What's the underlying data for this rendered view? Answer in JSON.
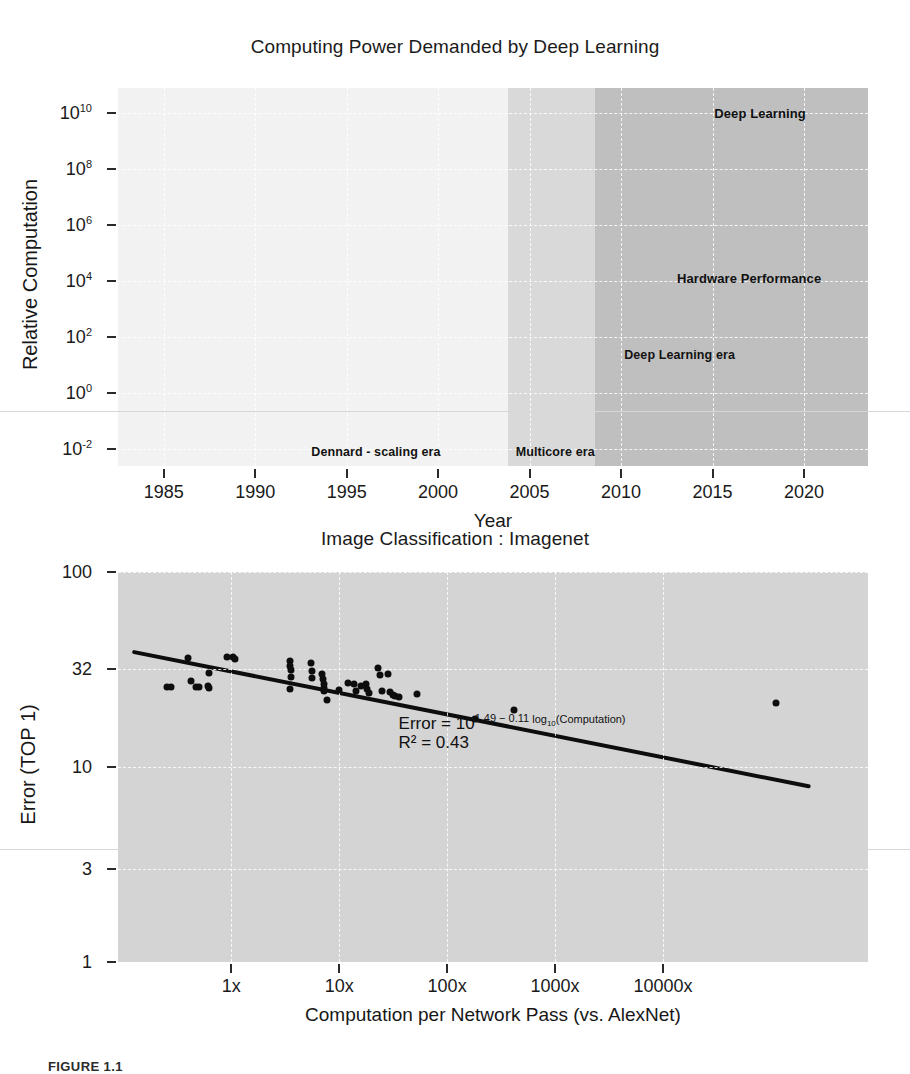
{
  "figure": {
    "caption_label": "FIGURE 1.1"
  },
  "chart_data": [
    {
      "type": "line",
      "title": "Computing Power Demanded by Deep Learning",
      "xlabel": "Year",
      "ylabel": "Relative Computation",
      "xlim": [
        1982.5,
        2023.5
      ],
      "ylim": [
        -2.6,
        10.9
      ],
      "xticks": [
        "1985",
        "1990",
        "1995",
        "2000",
        "2005",
        "2010",
        "2015",
        "2020"
      ],
      "xtick_values": [
        1985,
        1990,
        1995,
        2000,
        2005,
        2010,
        2015,
        2020
      ],
      "yticks": [
        "10-2",
        "100",
        "102",
        "104",
        "106",
        "108",
        "1010"
      ],
      "ytick_bases": [
        "10",
        "10",
        "10",
        "10",
        "10",
        "10",
        "10"
      ],
      "ytick_exponents": [
        "-2",
        "0",
        "2",
        "4",
        "6",
        "8",
        "10"
      ],
      "ytick_values": [
        -2,
        0,
        2,
        4,
        6,
        8,
        10
      ],
      "grid": true,
      "legend": "none",
      "annotations": [
        {
          "text": "Deep Learning",
          "x": 2017.6,
          "y": 10.0
        },
        {
          "text": "Hardware Performance",
          "x": 2017.0,
          "y": 4.1
        },
        {
          "text": "Deep Learning era",
          "x": 2013.2,
          "y": 1.35
        },
        {
          "text": "Dennard - scaling era",
          "x": 1996.6,
          "y": -2.1
        },
        {
          "text": "Multicore era",
          "x": 2006.4,
          "y": -2.1
        }
      ],
      "eras": [
        {
          "name": "Dennard - scaling era",
          "x_start": 1982.5,
          "x_end": 2003.8,
          "shade": "#f2f2f2"
        },
        {
          "name": "Multicore era",
          "x_start": 2003.8,
          "x_end": 2008.6,
          "shade": "#d9d9d9"
        },
        {
          "name": "Deep Learning era",
          "x_start": 2008.6,
          "x_end": 2023.5,
          "shade": "#bfbfbf"
        }
      ],
      "series": [
        {
          "name": "Hardware Performance",
          "color": "#111111",
          "style": "thick-line",
          "x": [
            1983,
            1985,
            1986,
            1988,
            1990,
            1992,
            1994,
            1996,
            1998,
            2000,
            2002,
            2003.8,
            2005,
            2006.5,
            2008.6
          ],
          "y": [
            -2.0,
            -2.0,
            -1.75,
            -1.25,
            -1.1,
            -0.75,
            -0.35,
            0.0,
            0.25,
            0.45,
            0.85,
            1.0,
            1.2,
            1.4,
            1.6
          ]
        },
        {
          "name": "Hardware Performance band (upper)",
          "color": "#111111",
          "style": "wedge-upper",
          "x": [
            2008.6,
            2016.2
          ],
          "y": [
            1.7,
            3.35
          ]
        },
        {
          "name": "Hardware Performance band (lower)",
          "color": "#111111",
          "style": "wedge-lower",
          "x": [
            2008.6,
            2016.2
          ],
          "y": [
            1.5,
            1.85
          ]
        },
        {
          "name": "Deep Learning",
          "color": "#b6b6b6",
          "style": "thin-line",
          "x": [
            1986.4,
            1987.5,
            1989,
            1990.5,
            1992,
            1994,
            1996,
            1998,
            2000,
            2002,
            2003.2,
            2004.6,
            2006,
            2008.6,
            2010.2,
            2012,
            2014,
            2016,
            2018,
            2020,
            2022,
            2023.5
          ],
          "y": [
            -2.55,
            -2.0,
            -0.9,
            -0.2,
            0.1,
            0.35,
            0.5,
            0.35,
            0.25,
            0.3,
            0.55,
            0.95,
            2.0,
            4.3,
            5.0,
            6.6,
            8.1,
            9.0,
            9.55,
            10.0,
            10.5,
            10.8
          ]
        }
      ]
    },
    {
      "type": "scatter",
      "title": "Image Classification : Imagenet",
      "xlabel": "Computation per Network Pass (vs. AlexNet)",
      "ylabel": "Error (TOP 1)",
      "xlim": [
        -1.05,
        5.9
      ],
      "ylim": [
        0,
        2
      ],
      "xticks": [
        "1x",
        "10x",
        "100x",
        "1000x",
        "10000x"
      ],
      "xtick_values": [
        0,
        1,
        2,
        3,
        4
      ],
      "yticks": [
        "100",
        "32",
        "10",
        "3",
        "1"
      ],
      "ytick_values": [
        2.0,
        1.505,
        1.0,
        0.477,
        0.0
      ],
      "grid": true,
      "legend": "none",
      "annotations": [
        {
          "text": "Error = 10",
          "sup_a": "1.49 − 0.11 ",
          "sup_log": "log",
          "sub_10": "10",
          "sup_tail": "(Computation)",
          "x": 1.55,
          "y": 1.27
        },
        {
          "text": "R² = 0.43",
          "x": 1.55,
          "y": 1.175
        }
      ],
      "fit": {
        "name": "regression-line",
        "equation": "Error = 10^(1.49 - 0.11 log10(Computation))",
        "r_squared": 0.43,
        "intercept": 1.49,
        "slope": -0.11,
        "color": "#0d0d0d",
        "x": [
          -0.9,
          5.35
        ],
        "y": [
          1.589,
          0.901
        ]
      },
      "points": [
        {
          "x": -0.6,
          "y": 1.41
        },
        {
          "x": -0.56,
          "y": 1.41
        },
        {
          "x": -0.4,
          "y": 1.56
        },
        {
          "x": -0.37,
          "y": 1.44
        },
        {
          "x": -0.33,
          "y": 1.41
        },
        {
          "x": -0.3,
          "y": 1.41
        },
        {
          "x": -0.21,
          "y": 1.48
        },
        {
          "x": -0.215,
          "y": 1.415
        },
        {
          "x": -0.205,
          "y": 1.405
        },
        {
          "x": -0.04,
          "y": 1.565
        },
        {
          "x": 0.02,
          "y": 1.565
        },
        {
          "x": 0.03,
          "y": 1.555
        },
        {
          "x": 0.54,
          "y": 1.545
        },
        {
          "x": 0.545,
          "y": 1.52
        },
        {
          "x": 0.55,
          "y": 1.495
        },
        {
          "x": 0.55,
          "y": 1.46
        },
        {
          "x": 0.545,
          "y": 1.4
        },
        {
          "x": 0.74,
          "y": 1.535
        },
        {
          "x": 0.745,
          "y": 1.49
        },
        {
          "x": 0.75,
          "y": 1.455
        },
        {
          "x": 0.84,
          "y": 1.475
        },
        {
          "x": 0.85,
          "y": 1.45
        },
        {
          "x": 0.855,
          "y": 1.425
        },
        {
          "x": 0.86,
          "y": 1.405
        },
        {
          "x": 0.86,
          "y": 1.39
        },
        {
          "x": 0.89,
          "y": 1.345
        },
        {
          "x": 1.0,
          "y": 1.395
        },
        {
          "x": 1.08,
          "y": 1.43
        },
        {
          "x": 1.14,
          "y": 1.425
        },
        {
          "x": 1.16,
          "y": 1.39
        },
        {
          "x": 1.2,
          "y": 1.415
        },
        {
          "x": 1.25,
          "y": 1.425
        },
        {
          "x": 1.26,
          "y": 1.4
        },
        {
          "x": 1.28,
          "y": 1.38
        },
        {
          "x": 1.36,
          "y": 1.51
        },
        {
          "x": 1.38,
          "y": 1.47
        },
        {
          "x": 1.4,
          "y": 1.39
        },
        {
          "x": 1.45,
          "y": 1.475
        },
        {
          "x": 1.47,
          "y": 1.385
        },
        {
          "x": 1.5,
          "y": 1.37
        },
        {
          "x": 1.52,
          "y": 1.365
        },
        {
          "x": 1.55,
          "y": 1.36
        },
        {
          "x": 1.72,
          "y": 1.375
        },
        {
          "x": 2.26,
          "y": 1.245
        },
        {
          "x": 2.62,
          "y": 1.29
        },
        {
          "x": 5.05,
          "y": 1.33
        }
      ]
    }
  ]
}
